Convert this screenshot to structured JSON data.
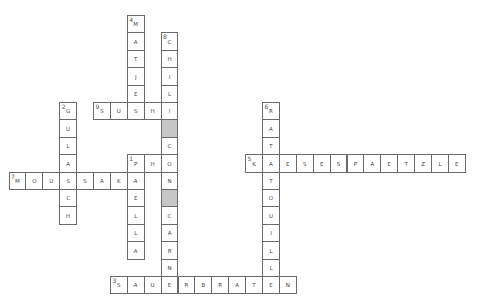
{
  "puzzle": {
    "grid": {
      "origin_x": 8.5,
      "origin_y": 15,
      "cell_w": 16.9,
      "cell_h": 17.4
    },
    "colors": {
      "border": "#6a6a6a",
      "blank_fill": "#c6c6c6",
      "cell_fill": "#ffffff",
      "text": "#444444"
    },
    "entries": [
      {
        "number": "1",
        "direction": "across",
        "answer": "PHO",
        "col": 7,
        "row": 8
      },
      {
        "number": "1",
        "direction": "down",
        "answer": "PAELLA",
        "col": 7,
        "row": 8
      },
      {
        "number": "2",
        "direction": "down",
        "answer": "GULASCH",
        "col": 3,
        "row": 5
      },
      {
        "number": "3",
        "direction": "across",
        "answer": "SAUERBRATEN",
        "col": 6,
        "row": 15
      },
      {
        "number": "4",
        "direction": "down",
        "answer": "MATJES",
        "col": 7,
        "row": 0
      },
      {
        "number": "5",
        "direction": "across",
        "answer": "KAESESPAETZLE",
        "col": 14,
        "row": 8
      },
      {
        "number": "6",
        "direction": "down",
        "answer": "RATATOUILLE",
        "col": 15,
        "row": 5
      },
      {
        "number": "7",
        "direction": "across",
        "answer": "MOUSSAKA",
        "col": 0,
        "row": 9
      },
      {
        "number": "8",
        "direction": "down",
        "answer": "CHILI#CON#CARNE",
        "col": 9,
        "row": 1
      },
      {
        "number": "9",
        "direction": "across",
        "answer": "SUSHI",
        "col": 5,
        "row": 5
      }
    ]
  }
}
